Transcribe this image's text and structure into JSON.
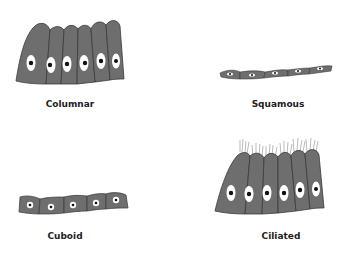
{
  "colors": {
    "cell_fill": "#6e6e6e",
    "cell_outline": "#3a3a3a",
    "nucleus_halo": "#ffffff",
    "nucleus": "#111111",
    "cilia": "#8a8a8a",
    "label": "#222222"
  },
  "panels": [
    {
      "id": "columnar",
      "label": "Columnar",
      "cell_count": 6
    },
    {
      "id": "squamous",
      "label": "Squamous",
      "cell_count": 5
    },
    {
      "id": "cuboid",
      "label": "Cuboid",
      "cell_count": 5
    },
    {
      "id": "ciliated",
      "label": "Ciliated",
      "cell_count": 6
    }
  ]
}
